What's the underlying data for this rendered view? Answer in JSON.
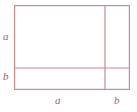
{
  "figure": {
    "kind": "geometry-diagram",
    "background_color": "#ffffff",
    "stroke_color": "#c98a8a",
    "label_color": "#a85a5a",
    "stroke_width": 1.2,
    "outer_rect": {
      "x": 14,
      "y": 5,
      "width": 116,
      "height": 85
    },
    "vertical_divider_x": 105,
    "horizontal_divider_y": 68,
    "labels": {
      "left_upper": "a",
      "left_lower": "b",
      "bottom_left": "a",
      "bottom_right": "b"
    },
    "segments": {
      "left_upper_name": "left-side-segment-a",
      "left_lower_name": "left-side-segment-b",
      "bottom_left_name": "bottom-side-segment-a",
      "bottom_right_name": "bottom-side-segment-b"
    }
  }
}
